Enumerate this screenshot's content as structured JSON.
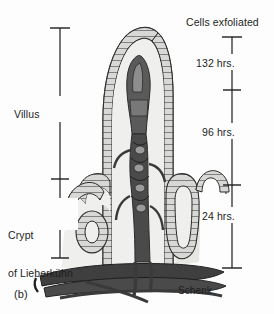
{
  "figure": {
    "panel_label": "(b)",
    "credit": "Schenk",
    "background_color": "#fdfdfd",
    "ink_color": "#1d1d1d"
  },
  "left_scale": {
    "name": "anatomy-bracket",
    "axis_x": 60,
    "top_y": 28,
    "mid_y": 179,
    "bottom_y": 258,
    "segments": [
      {
        "label": "Villus",
        "from_y": 28,
        "to_y": 179
      },
      {
        "label": "Crypt\nof Lieberkühn",
        "from_y": 179,
        "to_y": 258
      }
    ],
    "villus_label": "Villus",
    "crypt_label_line1": "Crypt",
    "crypt_label_line2": "of Lieberkühn"
  },
  "right_scale": {
    "name": "cell-migration-time-scale",
    "axis_x": 232,
    "title": "Cells exfoliated",
    "ticks_y": [
      37,
      90,
      185,
      268
    ],
    "segments": [
      {
        "label": "132 hrs.",
        "from_y": 37,
        "to_y": 90
      },
      {
        "label": "96 hrs.",
        "from_y": 90,
        "to_y": 185
      },
      {
        "label": "24 hrs.",
        "from_y": 185,
        "to_y": 268
      }
    ],
    "label_132": "132 hrs.",
    "label_96": "96 hrs.",
    "label_24": "24 hrs."
  },
  "structures": {
    "villus": "intestinal villus with columnar epithelium",
    "lamina_propria": "lamina propria core",
    "lacteal": "central lacteal and capillary network",
    "crypt_right": "crypt of Lieberkühn, longitudinal section",
    "crypt_cross": "crypt of Lieberkühn, cross section",
    "submucosa_vessels": "submucosal blood vessels"
  },
  "colors": {
    "tissue_fill": "#efefed",
    "epithelium_fill": "#d8d8d6",
    "vessel_dark": "#4a4a4a",
    "vessel_darker": "#3a3a3a",
    "outline": "#2b2b2b",
    "mucosa_shadow": "#e6e6e3"
  }
}
